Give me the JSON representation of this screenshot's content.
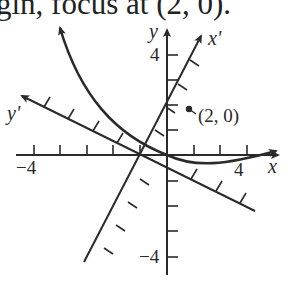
{
  "caption": "gin, focus at (2, 0).",
  "axes": {
    "x_label": "x",
    "y_label": "y",
    "x_prime_label": "x'",
    "y_prime_label": "y'",
    "x_tick_neg_label": "−4",
    "x_tick_pos_label": "4",
    "y_tick_pos_label": "4",
    "y_tick_neg_label": "−4"
  },
  "focus": {
    "label": "(2, 0)"
  },
  "colors": {
    "ink": "#2a2a2a",
    "background": "#ffffff"
  }
}
